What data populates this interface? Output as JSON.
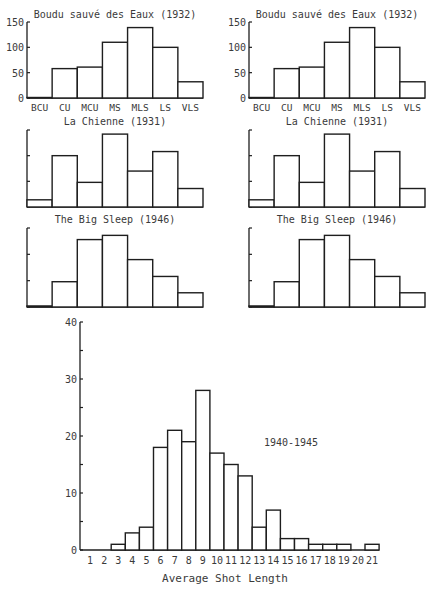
{
  "chart_data": [
    {
      "type": "bar",
      "title": "Boudu sauvé des Eaux (1932)",
      "categories": [
        "BCU",
        "CU",
        "MCU",
        "MS",
        "MLS",
        "LS",
        "VLS"
      ],
      "values": [
        1,
        58,
        61,
        110,
        139,
        100,
        32
      ],
      "yticks": [
        "0",
        "50",
        "100",
        "150"
      ],
      "ylim": [
        0,
        150
      ],
      "position": "top-left",
      "xlabel": "",
      "ylabel": "",
      "grid": false
    },
    {
      "type": "bar",
      "title": "Boudu sauvé des Eaux (1932)",
      "categories": [
        "BCU",
        "CU",
        "MCU",
        "MS",
        "MLS",
        "LS",
        "VLS"
      ],
      "values": [
        1,
        58,
        61,
        110,
        139,
        100,
        32
      ],
      "yticks": [
        "0",
        "50",
        "100",
        "150"
      ],
      "ylim": [
        0,
        150
      ],
      "position": "top-right",
      "xlabel": "",
      "ylabel": "",
      "grid": false
    },
    {
      "type": "bar",
      "title": "La Chienne (1931)",
      "categories": [
        "BCU",
        "CU",
        "MCU",
        "MS",
        "MLS",
        "LS",
        "VLS"
      ],
      "values": [
        14,
        100,
        48,
        142,
        70,
        108,
        36
      ],
      "yticks": [],
      "ylim": [
        0,
        150
      ],
      "position": "middle-left",
      "xlabel": "",
      "ylabel": "",
      "grid": false
    },
    {
      "type": "bar",
      "title": "La Chienne (1931)",
      "categories": [
        "BCU",
        "CU",
        "MCU",
        "MS",
        "MLS",
        "LS",
        "VLS"
      ],
      "values": [
        14,
        100,
        48,
        142,
        70,
        108,
        36
      ],
      "yticks": [],
      "ylim": [
        0,
        150
      ],
      "position": "middle-right",
      "xlabel": "",
      "ylabel": "",
      "grid": false
    },
    {
      "type": "bar",
      "title": "The Big Sleep (1946)",
      "categories": [
        "BCU",
        "CU",
        "MCU",
        "MS",
        "MLS",
        "LS",
        "VLS"
      ],
      "values": [
        2,
        48,
        128,
        136,
        90,
        58,
        27
      ],
      "yticks": [],
      "ylim": [
        0,
        150
      ],
      "position": "lower-left",
      "xlabel": "",
      "ylabel": "",
      "grid": false
    },
    {
      "type": "bar",
      "title": "The Big Sleep (1946)",
      "categories": [
        "BCU",
        "CU",
        "MCU",
        "MS",
        "MLS",
        "LS",
        "VLS"
      ],
      "values": [
        2,
        48,
        128,
        136,
        90,
        58,
        27
      ],
      "yticks": [],
      "ylim": [
        0,
        150
      ],
      "position": "lower-right",
      "xlabel": "",
      "ylabel": "",
      "grid": false
    },
    {
      "type": "bar",
      "title": "",
      "annotation": "1940-1945",
      "categories": [
        "1",
        "2",
        "3",
        "4",
        "5",
        "6",
        "7",
        "8",
        "9",
        "10",
        "11",
        "12",
        "13",
        "14",
        "15",
        "16",
        "17",
        "18",
        "19",
        "20",
        "21"
      ],
      "values": [
        0,
        0,
        1,
        3,
        4,
        18,
        21,
        19,
        28,
        17,
        15,
        13,
        4,
        7,
        2,
        2,
        1,
        1,
        1,
        0,
        1
      ],
      "yticks": [
        "0",
        "10",
        "20",
        "30",
        "40"
      ],
      "ylim": [
        0,
        40
      ],
      "xlabel": "Average Shot Length",
      "ylabel": "",
      "position": "bottom",
      "grid": false
    }
  ],
  "labels": {
    "bottom_xlabel": "Average Shot Length",
    "bottom_annotation": "1940-1945"
  }
}
